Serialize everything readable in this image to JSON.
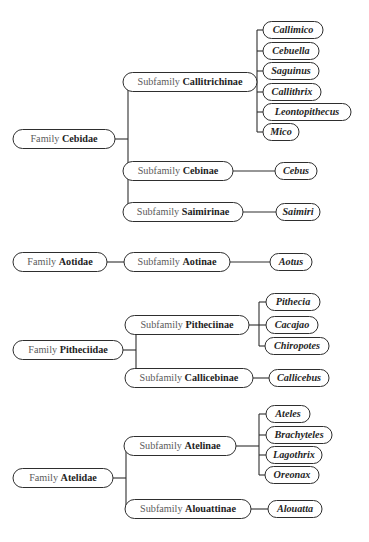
{
  "diagram": {
    "type": "tree",
    "width": 369,
    "height": 542,
    "colors": {
      "background": "#ffffff",
      "stroke": "#2e2e2e",
      "rank_text": "#5a5a5a",
      "taxon_text": "#232323",
      "genus_text": "#1f1f1f"
    },
    "labels": {
      "rank_family": "Family",
      "rank_subfamily": "Subfamily"
    },
    "groups": [
      {
        "id": "cebidae",
        "family": {
          "rank": "Family",
          "name": "Cebidae",
          "cx": 64,
          "cy": 139,
          "w": 102,
          "h": 19
        },
        "subfamilies": [
          {
            "rank": "Subfamily",
            "name": "Callitrichinae",
            "cx": 190,
            "cy": 82,
            "w": 134,
            "h": 19,
            "genera": [
              {
                "name": "Callimico",
                "cx": 293,
                "cy": 30,
                "w": 60,
                "h": 17
              },
              {
                "name": "Cebuella",
                "cx": 291,
                "cy": 51,
                "w": 56,
                "h": 17
              },
              {
                "name": "Saguinus",
                "cx": 291,
                "cy": 71,
                "w": 56,
                "h": 17
              },
              {
                "name": "Callithrix",
                "cx": 292,
                "cy": 92,
                "w": 58,
                "h": 17
              },
              {
                "name": "Leontopithecus",
                "cx": 307,
                "cy": 112,
                "w": 88,
                "h": 17
              },
              {
                "name": "Mico",
                "cx": 281,
                "cy": 132,
                "w": 36,
                "h": 17
              }
            ]
          },
          {
            "rank": "Subfamily",
            "name": "Cebinae",
            "cx": 178,
            "cy": 171,
            "w": 110,
            "h": 19,
            "genera": [
              {
                "name": "Cebus",
                "cx": 296,
                "cy": 171,
                "w": 42,
                "h": 17
              }
            ]
          },
          {
            "rank": "Subfamily",
            "name": "Saimirinae",
            "cx": 183,
            "cy": 212,
            "w": 120,
            "h": 19,
            "genera": [
              {
                "name": "Saimiri",
                "cx": 298,
                "cy": 212,
                "w": 44,
                "h": 17
              }
            ]
          }
        ]
      },
      {
        "id": "aotidae",
        "family": {
          "rank": "Family",
          "name": "Aotidae",
          "cx": 60,
          "cy": 262,
          "w": 94,
          "h": 19
        },
        "subfamilies": [
          {
            "rank": "Subfamily",
            "name": "Aotinae",
            "cx": 177,
            "cy": 262,
            "w": 106,
            "h": 19,
            "genera": [
              {
                "name": "Aotus",
                "cx": 291,
                "cy": 262,
                "w": 42,
                "h": 17
              }
            ]
          }
        ]
      },
      {
        "id": "pitheciidae",
        "family": {
          "rank": "Family",
          "name": "Pitheciidae",
          "cx": 68,
          "cy": 350,
          "w": 110,
          "h": 19
        },
        "subfamilies": [
          {
            "rank": "Subfamily",
            "name": "Pitheciinae",
            "cx": 187,
            "cy": 325,
            "w": 124,
            "h": 19,
            "genera": [
              {
                "name": "Pithecia",
                "cx": 293,
                "cy": 302,
                "w": 54,
                "h": 17
              },
              {
                "name": "Cacajao",
                "cx": 292,
                "cy": 325,
                "w": 52,
                "h": 17
              },
              {
                "name": "Chiropotes",
                "cx": 297,
                "cy": 346,
                "w": 64,
                "h": 17
              }
            ]
          },
          {
            "rank": "Subfamily",
            "name": "Callicebinae",
            "cx": 189,
            "cy": 378,
            "w": 128,
            "h": 19,
            "genera": [
              {
                "name": "Callicebus",
                "cx": 299,
                "cy": 378,
                "w": 60,
                "h": 17
              }
            ]
          }
        ]
      },
      {
        "id": "atelidae",
        "family": {
          "rank": "Family",
          "name": "Atelidae",
          "cx": 63,
          "cy": 478,
          "w": 100,
          "h": 19
        },
        "subfamilies": [
          {
            "rank": "Subfamily",
            "name": "Atelinae",
            "cx": 180,
            "cy": 446,
            "w": 112,
            "h": 19,
            "genera": [
              {
                "name": "Ateles",
                "cx": 288,
                "cy": 414,
                "w": 44,
                "h": 17
              },
              {
                "name": "Brachyteles",
                "cx": 299,
                "cy": 435,
                "w": 66,
                "h": 17
              },
              {
                "name": "Lagothrix",
                "cx": 294,
                "cy": 455,
                "w": 56,
                "h": 17
              },
              {
                "name": "Oreonax",
                "cx": 292,
                "cy": 475,
                "w": 54,
                "h": 17
              }
            ]
          },
          {
            "rank": "Subfamily",
            "name": "Alouattinae",
            "cx": 188,
            "cy": 509,
            "w": 126,
            "h": 19,
            "genera": [
              {
                "name": "Alouatta",
                "cx": 295,
                "cy": 509,
                "w": 54,
                "h": 17
              }
            ]
          }
        ]
      }
    ]
  }
}
